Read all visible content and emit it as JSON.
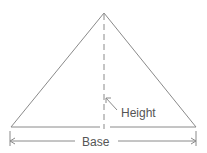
{
  "diagram": {
    "labels": {
      "height": "Height",
      "base": "Base"
    },
    "colors": {
      "stroke": "#8a8a8a",
      "text": "#555555"
    }
  }
}
